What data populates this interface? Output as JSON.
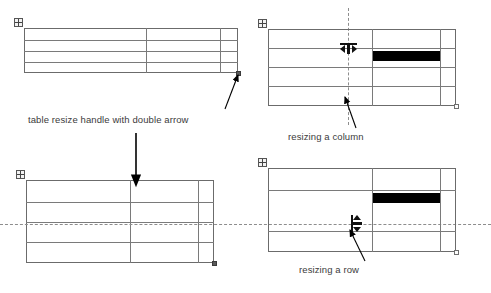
{
  "diagram": {
    "captions": [
      {
        "id": "handle",
        "text": "table resize handle with double arrow"
      },
      {
        "id": "column",
        "text": "resizing a column"
      },
      {
        "id": "row",
        "text": "resizing a row"
      }
    ],
    "colors": {
      "grid_line": "#7a7a7a",
      "outer_border": "#6b6b6b",
      "selection_fill": "#000000",
      "guide_line": "#8d8d8d",
      "caption_text": "#3b3b3b",
      "annotation_arrow": "#000000",
      "page_background": "#ffffff"
    },
    "panels": [
      {
        "id": "top-left",
        "name": "table-before-resize",
        "rows": 4,
        "columns": 3,
        "row_heights": [
          12,
          11,
          11,
          11
        ],
        "column_widths": [
          130,
          72,
          16
        ],
        "has_move_handle": true,
        "has_resize_grip": true,
        "selected_cell": null,
        "guide": null,
        "cursor": "resize-grip-double-arrow"
      },
      {
        "id": "top-right",
        "name": "table-resizing-column",
        "rows": 4,
        "columns": 3,
        "row_heights": [
          19,
          19,
          19,
          19
        ],
        "column_widths": [
          104,
          68,
          16
        ],
        "has_move_handle": true,
        "has_resize_grip": true,
        "selected_cell": {
          "row": 2,
          "column": 2
        },
        "guide": "vertical-dashed",
        "cursor": "col-resize"
      },
      {
        "id": "bottom-left",
        "name": "table-after-resize",
        "rows": 4,
        "columns": 3,
        "row_heights": [
          22,
          20,
          20,
          21
        ],
        "column_widths": [
          104,
          68,
          16
        ],
        "has_move_handle": true,
        "has_resize_grip": true,
        "selected_cell": null,
        "guide": null,
        "cursor": "down-arrow-pointer"
      },
      {
        "id": "bottom-right",
        "name": "table-resizing-row",
        "rows": 4,
        "columns": 3,
        "row_heights": [
          22,
          20,
          20,
          22
        ],
        "column_widths": [
          104,
          68,
          16
        ],
        "has_move_handle": true,
        "has_resize_grip": true,
        "selected_cell": {
          "row": 2,
          "column": 2
        },
        "guide": "horizontal-dashed",
        "cursor": "row-resize"
      }
    ]
  }
}
